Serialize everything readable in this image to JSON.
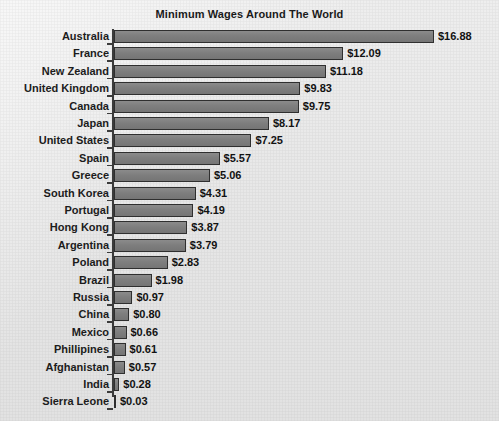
{
  "chart_data": {
    "type": "bar",
    "orientation": "horizontal",
    "title": "Minimum Wages Around The World",
    "xlabel": "",
    "ylabel": "",
    "xlim": [
      0,
      16.88
    ],
    "grid": false,
    "legend": false,
    "value_prefix": "$",
    "bar_color": "#7e7e7e",
    "bar_border_color": "#2f2f2f",
    "background_color": "#e8e8e8",
    "text_color": "#1c1c1c",
    "categories": [
      "Australia",
      "France",
      "New Zealand",
      "United Kingdom",
      "Canada",
      "Japan",
      "United States",
      "Spain",
      "Greece",
      "South Korea",
      "Portugal",
      "Hong Kong",
      "Argentina",
      "Poland",
      "Brazil",
      "Russia",
      "China",
      "Mexico",
      "Phillipines",
      "Afghanistan",
      "India",
      "Sierra Leone"
    ],
    "values": [
      16.88,
      12.09,
      11.18,
      9.83,
      9.75,
      8.17,
      7.25,
      5.57,
      5.06,
      4.31,
      4.19,
      3.87,
      3.79,
      2.83,
      1.98,
      0.97,
      0.8,
      0.66,
      0.61,
      0.57,
      0.28,
      0.03
    ],
    "data_labels": [
      "$16.88",
      "$12.09",
      "$11.18",
      "$9.83",
      "$9.75",
      "$8.17",
      "$7.25",
      "$5.57",
      "$5.06",
      "$4.31",
      "$4.19",
      "$3.87",
      "$3.79",
      "$2.83",
      "$1.98",
      "$0.97",
      "$0.80",
      "$0.66",
      "$0.61",
      "$0.57",
      "$0.28",
      "$0.03"
    ]
  }
}
